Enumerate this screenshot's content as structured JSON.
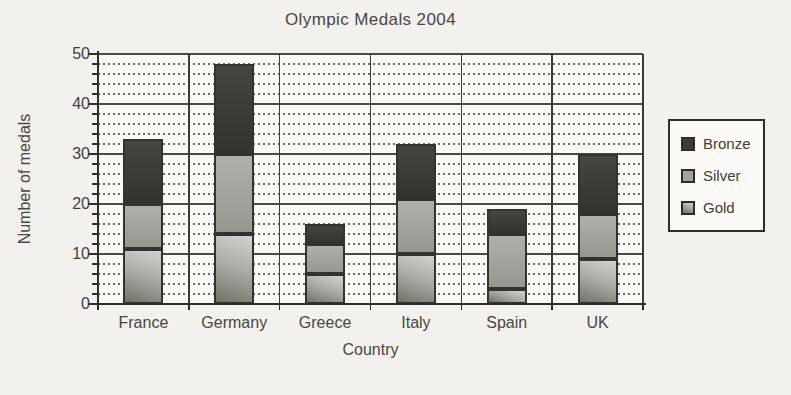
{
  "chart_data": {
    "type": "bar",
    "stacked": true,
    "title": "Olympic Medals 2004",
    "xlabel": "Country",
    "ylabel": "Number of medals",
    "categories": [
      "France",
      "Germany",
      "Greece",
      "Italy",
      "Spain",
      "UK"
    ],
    "series": [
      {
        "name": "Gold",
        "values": [
          11,
          14,
          6,
          10,
          3,
          9
        ]
      },
      {
        "name": "Silver",
        "values": [
          9,
          16,
          6,
          11,
          11,
          9
        ]
      },
      {
        "name": "Bronze",
        "values": [
          13,
          18,
          4,
          11,
          5,
          12
        ]
      }
    ],
    "ylim": [
      0,
      50
    ],
    "yticks": [
      0,
      10,
      20,
      30,
      40,
      50
    ],
    "minor_gridline_step": 2,
    "grid": true,
    "legend": {
      "position": "right",
      "entries": [
        "Bronze",
        "Silver",
        "Gold"
      ]
    },
    "colors": {
      "bronze": "#3b3a37",
      "silver": "#a3a29f",
      "gold_light": "#d3d2ce",
      "gold_dark": "#737268",
      "axis": "#2e2d2b",
      "gridline": "#56534d",
      "page_background": "#f2f1ed"
    }
  }
}
